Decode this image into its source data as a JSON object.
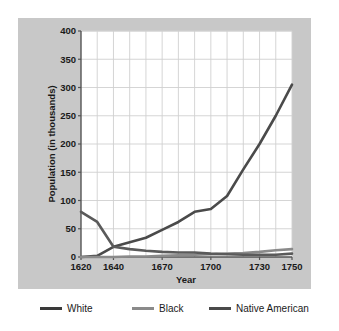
{
  "figure": {
    "panel_bg": "#c8c8c8",
    "plot_bg": "#ffffff",
    "grid_color": "#d0d0d0",
    "text_color": "#1a1a1a"
  },
  "chart_data": {
    "type": "line",
    "title": "",
    "xlabel": "Year",
    "ylabel": "Population (in thousands)",
    "xlim": [
      1620,
      1750
    ],
    "ylim": [
      0,
      400
    ],
    "ytick_labels": [
      "0",
      "50",
      "100",
      "150",
      "200",
      "250",
      "300",
      "350",
      "400"
    ],
    "yticks": [
      0,
      50,
      100,
      150,
      200,
      250,
      300,
      350,
      400
    ],
    "xtick_labels": [
      "1620",
      "1640",
      "1670",
      "1700",
      "1730",
      "1750"
    ],
    "xticks": [
      1620,
      1640,
      1670,
      1700,
      1730,
      1750
    ],
    "grid": true,
    "grid_axis": "both",
    "legend_position": "below",
    "series": [
      {
        "name": "White",
        "color": "#4a4a4a",
        "x": [
          1620,
          1630,
          1640,
          1650,
          1660,
          1670,
          1680,
          1690,
          1700,
          1710,
          1720,
          1730,
          1740,
          1750
        ],
        "values": [
          0,
          2,
          18,
          26,
          34,
          48,
          62,
          80,
          85,
          108,
          155,
          200,
          250,
          305
        ]
      },
      {
        "name": "Black",
        "color": "#8a8a8a",
        "x": [
          1620,
          1630,
          1640,
          1650,
          1660,
          1670,
          1680,
          1690,
          1700,
          1710,
          1720,
          1730,
          1740,
          1750
        ],
        "values": [
          0,
          0,
          0,
          1,
          1,
          2,
          3,
          4,
          5,
          6,
          7,
          9,
          12,
          14
        ]
      },
      {
        "name": "Native American",
        "color": "#5a5a5a",
        "x": [
          1620,
          1630,
          1640,
          1650,
          1660,
          1670,
          1680,
          1690,
          1700,
          1710,
          1720,
          1730,
          1740,
          1750
        ],
        "values": [
          80,
          62,
          18,
          14,
          11,
          9,
          8,
          8,
          6,
          5,
          4,
          4,
          4,
          6
        ]
      }
    ]
  },
  "legend": {
    "items": [
      {
        "label": "White",
        "color": "#3a3a3a"
      },
      {
        "label": "Black",
        "color": "#8a8a8a"
      },
      {
        "label": "Native American",
        "color": "#4a4a4a"
      }
    ]
  }
}
